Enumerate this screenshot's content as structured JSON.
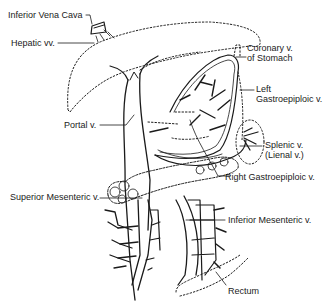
{
  "figure": {
    "style": "black line-art on white",
    "labels": {
      "ivc": "Inferior Vena Cava",
      "hepatic": "Hepatic vv.",
      "coronary_1": "Coronary v.",
      "coronary_2": "of  Stomach",
      "left_ge_1": "Left",
      "left_ge_2": "Gastroepiploic v.",
      "portal": "Portal v.",
      "splenic_1": "Splenic v.",
      "splenic_2": "(Lienal v.)",
      "right_ge": "Right Gastroepiploic v.",
      "sup_mes": "Superior Mesenteric v.",
      "inf_mes": "Inferior Mesenteric v.",
      "rectum": "Rectum"
    },
    "colors": {
      "line": "#1a1a1a",
      "background": "#ffffff"
    }
  }
}
